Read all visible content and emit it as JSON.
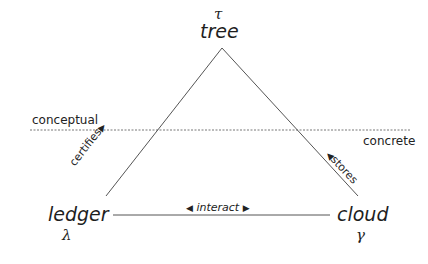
{
  "nodes": {
    "tree": {
      "label": "tree",
      "symbol": "τ"
    },
    "ledger": {
      "label": "ledger",
      "symbol": "λ"
    },
    "cloud": {
      "label": "cloud",
      "symbol": "γ"
    }
  },
  "edges": {
    "certifies": {
      "label": "certifies",
      "from": "ledger",
      "to": "tree",
      "arrow": "▶"
    },
    "stores": {
      "label": "stores",
      "from": "cloud",
      "to": "tree",
      "arrow": "◀"
    },
    "interact": {
      "label": "interact",
      "from": "ledger",
      "to": "cloud",
      "arrow_left": "◀",
      "arrow_right": "▶"
    }
  },
  "regions": {
    "conceptual": "conceptual",
    "concrete": "concrete"
  },
  "colors": {
    "line": "#555555",
    "text": "#1e1e1e",
    "background": "#ffffff"
  }
}
